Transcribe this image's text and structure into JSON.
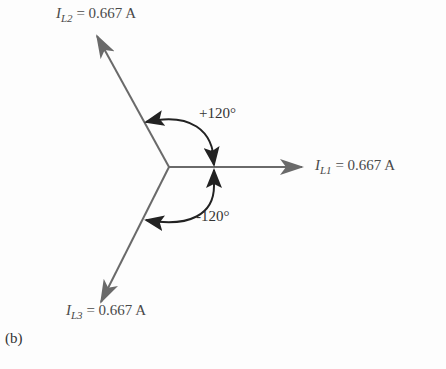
{
  "figure_label": "(b)",
  "phasors": [
    {
      "name": "I",
      "sub": "L1",
      "value": "= 0.667 A",
      "angle_deg": 0
    },
    {
      "name": "I",
      "sub": "L2",
      "value": "= 0.667 A",
      "angle_deg": 120
    },
    {
      "name": "I",
      "sub": "L3",
      "value": "= 0.667 A",
      "angle_deg": -120
    }
  ],
  "angles": {
    "positive": "+120°",
    "negative": "-120°"
  },
  "colors": {
    "phasor": "#6a6a6a",
    "arc": "#222222"
  }
}
